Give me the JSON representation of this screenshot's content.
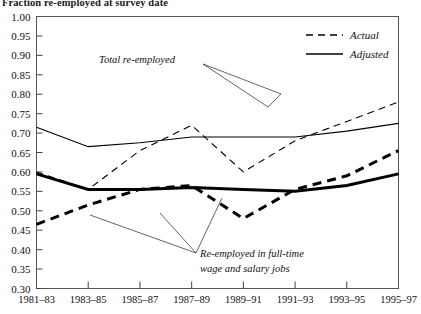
{
  "chart_data": {
    "type": "line",
    "title": "Fraction re-employed at survey date",
    "xlabel": "",
    "ylabel": "",
    "grid": false,
    "ylim": [
      0.3,
      1.0
    ],
    "ytick_step": 0.05,
    "categories": [
      "1981–83",
      "1983–85",
      "1985–87",
      "1987–89",
      "1989–91",
      "1991–93",
      "1993–95",
      "1995–97"
    ],
    "ytick_labels": [
      "1.00",
      "0.95",
      "0.90",
      "0.85",
      "0.80",
      "0.75",
      "0.70",
      "0.65",
      "0.60",
      "0.55",
      "0.50",
      "0.45",
      "0.40",
      "0.35",
      "0.30"
    ],
    "legend": {
      "position": "top-right",
      "entries": [
        {
          "label": "Actual",
          "style": "dashed"
        },
        {
          "label": "Adjusted",
          "style": "solid"
        }
      ]
    },
    "annotations": [
      {
        "text": "Total re-employed",
        "lines": 1
      },
      {
        "text": "Re-employed in full-time",
        "lines": 2
      },
      {
        "text": "wage and salary jobs",
        "lines": 2
      }
    ],
    "series": [
      {
        "name": "Total re-employed — Actual",
        "group": "Total re-employed",
        "style": "dashed",
        "weight": "thin",
        "values": [
          0.6,
          0.555,
          0.655,
          0.72,
          0.6,
          0.68,
          0.73,
          0.78
        ]
      },
      {
        "name": "Total re-employed — Adjusted",
        "group": "Total re-employed",
        "style": "solid",
        "weight": "thin",
        "values": [
          0.715,
          0.665,
          0.675,
          0.69,
          0.69,
          0.69,
          0.705,
          0.725
        ]
      },
      {
        "name": "Re-employed in full-time wage and salary jobs — Actual",
        "group": "Re-employed in full-time wage and salary jobs",
        "style": "dashed",
        "weight": "thick",
        "values": [
          0.465,
          0.515,
          0.555,
          0.565,
          0.48,
          0.555,
          0.59,
          0.655
        ]
      },
      {
        "name": "Re-employed in full-time wage and salary jobs — Adjusted",
        "group": "Re-employed in full-time wage and salary jobs",
        "style": "solid",
        "weight": "thick",
        "values": [
          0.595,
          0.555,
          0.555,
          0.56,
          0.555,
          0.55,
          0.565,
          0.595
        ]
      }
    ],
    "colors": {
      "line": "#000000",
      "axis": "#444444",
      "background": "#ffffff",
      "text": "#111111"
    }
  }
}
